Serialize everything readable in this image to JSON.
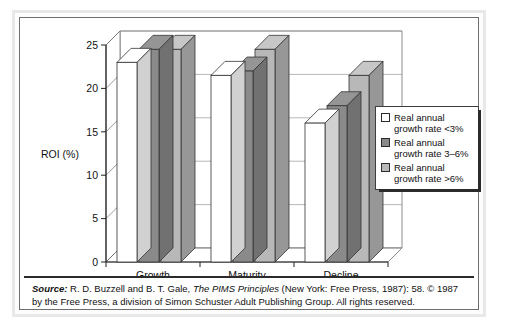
{
  "chart_data": {
    "type": "bar",
    "title": "",
    "xlabel": "",
    "ylabel": "ROI (%)",
    "categories": [
      "Growth",
      "Maturity",
      "Decline"
    ],
    "ylim": [
      0,
      25
    ],
    "yticks": [
      0,
      5,
      10,
      15,
      20,
      25
    ],
    "ytick_labels": [
      "0",
      "5",
      "10",
      "15",
      "20",
      "25"
    ],
    "grid": true,
    "legend_position": "right",
    "style": "3d-bar",
    "series": [
      {
        "name": "Real annual growth rate <3%",
        "color": "#ffffff",
        "values": [
          23.0,
          21.5,
          16.0
        ]
      },
      {
        "name": "Real annual growth rate 3–6%",
        "color": "#8a8a8a",
        "values": [
          24.5,
          22.0,
          18.0
        ]
      },
      {
        "name": "Real annual growth rate >6%",
        "color": "#b8b8b8",
        "values": [
          24.5,
          24.5,
          21.5
        ]
      }
    ]
  },
  "legend": {
    "items": [
      {
        "swatch_color": "#ffffff",
        "line1": "Real annual",
        "line2": "growth rate <3%"
      },
      {
        "swatch_color": "#8a8a8a",
        "line1": "Real annual",
        "line2": "growth rate 3–6%"
      },
      {
        "swatch_color": "#b8b8b8",
        "line1": "Real annual",
        "line2": "growth rate >6%"
      }
    ]
  },
  "source": {
    "label": "Source:",
    "text_part1": " R. D. Buzzell and B. T. Gale, ",
    "title_italic": "The PIMS Principles",
    "text_part2": " (New York: Free Press, 1987): 58. © 1987 by the Free Press, a division of Simon Schuster Adult Publishing Group. All rights reserved."
  },
  "colors": {
    "series_white": "#ffffff",
    "series_dark_gray": "#8a8a8a",
    "series_light_gray": "#b8b8b8",
    "frame": "#6f6f6f",
    "text": "#111111"
  }
}
